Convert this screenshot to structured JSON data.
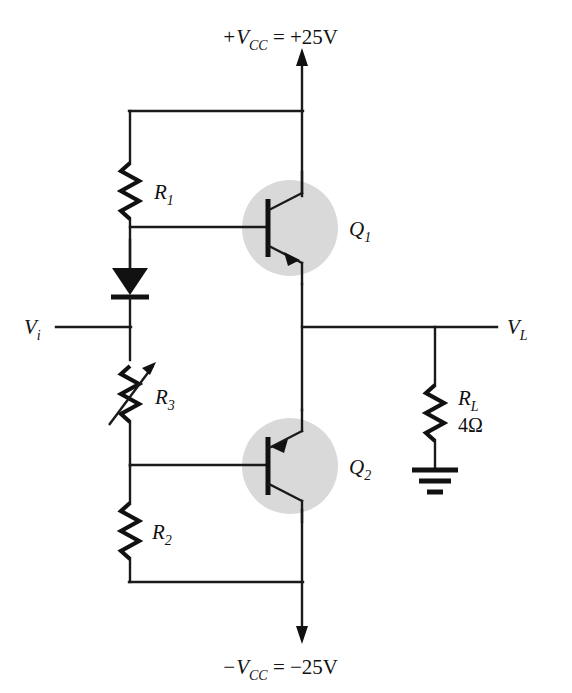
{
  "figure": {
    "kind": "circuit-schematic",
    "title_visible": false,
    "background_color": "#ffffff",
    "line_color": "#1a1a1a",
    "transistor_highlight_color": "#d9d9d9"
  },
  "supplies": {
    "positive": {
      "symbol": "+V",
      "subscript": "CC",
      "equals": " = ",
      "value": "+25V",
      "full_label": "+VCC = +25V",
      "arrow": "up"
    },
    "negative": {
      "symbol": "−V",
      "subscript": "CC",
      "equals": " = ",
      "value": "−25V",
      "full_label": "−VCC = −25V",
      "arrow": "down"
    }
  },
  "terminals": {
    "input": {
      "symbol": "V",
      "subscript": "i",
      "full_label": "Vi"
    },
    "output": {
      "symbol": "V",
      "subscript": "L",
      "full_label": "VL"
    }
  },
  "components": [
    {
      "id": "R1",
      "type": "resistor",
      "symbol": "R",
      "subscript": "1",
      "value": "",
      "orientation": "vertical"
    },
    {
      "id": "D1",
      "type": "diode",
      "symbol": "",
      "subscript": "",
      "value": "",
      "orientation": "vertical-down"
    },
    {
      "id": "R3",
      "type": "variable-resistor",
      "symbol": "R",
      "subscript": "3",
      "value": "",
      "orientation": "vertical"
    },
    {
      "id": "R2",
      "type": "resistor",
      "symbol": "R",
      "subscript": "2",
      "value": "",
      "orientation": "vertical"
    },
    {
      "id": "Q1",
      "type": "transistor-npn",
      "symbol": "Q",
      "subscript": "1",
      "value": "",
      "orientation": "collector-up"
    },
    {
      "id": "Q2",
      "type": "transistor-pnp",
      "symbol": "Q",
      "subscript": "2",
      "value": "",
      "orientation": "emitter-up"
    },
    {
      "id": "RL",
      "type": "resistor",
      "symbol": "R",
      "subscript": "L",
      "value": "4Ω",
      "orientation": "vertical"
    },
    {
      "id": "GND",
      "type": "ground",
      "symbol": "",
      "subscript": "",
      "value": "",
      "orientation": "down"
    }
  ],
  "labels": {
    "r1": {
      "base": "R",
      "sub": "1"
    },
    "r2": {
      "base": "R",
      "sub": "2"
    },
    "r3": {
      "base": "R",
      "sub": "3"
    },
    "rl": {
      "base": "R",
      "sub": "L",
      "value": "4Ω"
    },
    "q1": {
      "base": "Q",
      "sub": "1"
    },
    "q2": {
      "base": "Q",
      "sub": "2"
    },
    "vi": {
      "base": "V",
      "sub": "i"
    },
    "vl": {
      "base": "V",
      "sub": "L"
    },
    "vcc_pos": {
      "sign": "+V",
      "sub": "CC",
      "rhs": " = +25V"
    },
    "vcc_neg": {
      "sign": "−V",
      "sub": "CC",
      "rhs": " = −25V"
    }
  }
}
